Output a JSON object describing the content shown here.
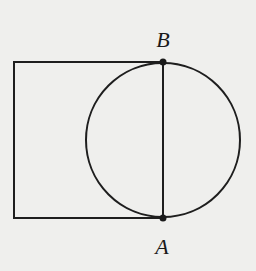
{
  "diagram": {
    "colors": {
      "background": "#efefed",
      "stroke": "#1e1e1e"
    },
    "rectangle": {
      "x": 14,
      "y": 62,
      "width": 149,
      "height": 156
    },
    "circle": {
      "cx": 163,
      "cy": 140,
      "r": 77
    },
    "segment_AB": {
      "x1": 163,
      "y1": 62,
      "x2": 163,
      "y2": 218
    },
    "points": [
      {
        "name": "B",
        "x": 163,
        "y": 62,
        "label": "B",
        "label_x": 163,
        "label_y": 47
      },
      {
        "name": "A",
        "x": 163,
        "y": 218,
        "label": "A",
        "label_x": 162,
        "label_y": 254
      }
    ]
  }
}
